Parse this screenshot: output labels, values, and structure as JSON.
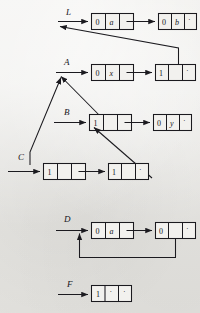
{
  "figure": {
    "background_color": "#e9e8e4",
    "ink_color": "#1b1a1f",
    "node_fill": "#f2f1ee",
    "rows": [
      {
        "label": "L",
        "name": "list-row-l",
        "nodes": [
          {
            "name": "node-l-1",
            "cells": [
              "0",
              "a",
              ""
            ],
            "link": "arrow-right"
          },
          {
            "name": "node-l-2",
            "cells": [
              "0",
              "b",
              "·"
            ],
            "link": "nil"
          }
        ]
      },
      {
        "label": "A",
        "name": "list-row-a",
        "nodes": [
          {
            "name": "node-a-1",
            "cells": [
              "0",
              "x",
              ""
            ],
            "link": "arrow-right"
          },
          {
            "name": "node-a-2",
            "cells": [
              "1",
              "",
              "·"
            ],
            "link": "nil"
          }
        ]
      },
      {
        "label": "B",
        "name": "list-row-b",
        "nodes": [
          {
            "name": "node-b-1",
            "cells": [
              "1",
              "",
              ""
            ],
            "link": "arrow-right"
          },
          {
            "name": "node-b-2",
            "cells": [
              "0",
              "y",
              "·"
            ],
            "link": "nil"
          }
        ]
      },
      {
        "label": "C",
        "name": "list-row-c",
        "nodes": [
          {
            "name": "node-c-1",
            "cells": [
              "1",
              "",
              ""
            ],
            "link": "arrow-right"
          },
          {
            "name": "node-c-2",
            "cells": [
              "1",
              "",
              "·"
            ],
            "link": "nil"
          }
        ]
      },
      {
        "label": "D",
        "name": "list-row-d",
        "nodes": [
          {
            "name": "node-d-1",
            "cells": [
              "0",
              "a",
              ""
            ],
            "link": "arrow-right"
          },
          {
            "name": "node-d-2",
            "cells": [
              "0",
              "",
              "·"
            ],
            "link": "loop-back"
          }
        ]
      },
      {
        "label": "F",
        "name": "list-row-f",
        "nodes": [
          {
            "name": "node-f-1",
            "cells": [
              "1",
              "·",
              "·"
            ],
            "link": "nil"
          }
        ]
      }
    ]
  },
  "labels": {
    "l": "L",
    "a": "A",
    "b": "B",
    "c": "C",
    "d": "D",
    "f": "F"
  },
  "cells": {
    "l1": {
      "tag": "0",
      "atom": "a",
      "ptr": ""
    },
    "l2": {
      "tag": "0",
      "atom": "b",
      "ptr": "·"
    },
    "a1": {
      "tag": "0",
      "atom": "x",
      "ptr": ""
    },
    "a2": {
      "tag": "1",
      "atom": "",
      "ptr": "·"
    },
    "b1": {
      "tag": "1",
      "atom": "",
      "ptr": ""
    },
    "b2": {
      "tag": "0",
      "atom": "y",
      "ptr": "·"
    },
    "c1": {
      "tag": "1",
      "atom": "",
      "ptr": ""
    },
    "c2": {
      "tag": "1",
      "atom": "",
      "ptr": "·"
    },
    "d1": {
      "tag": "0",
      "atom": "a",
      "ptr": ""
    },
    "d2": {
      "tag": "0",
      "atom": "",
      "ptr": "·"
    },
    "f1": {
      "tag": "1",
      "atom": "·",
      "ptr": "·"
    }
  }
}
